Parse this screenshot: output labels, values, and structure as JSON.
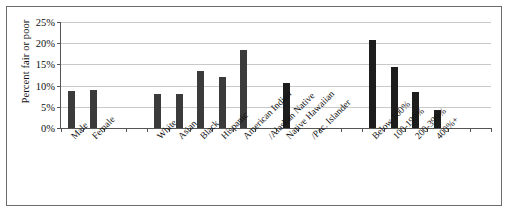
{
  "chart_data": {
    "type": "bar",
    "title": "",
    "subtitle": "",
    "xlabel": "",
    "ylabel": "Percent fair or poor",
    "ylim": [
      0,
      25
    ],
    "ytick_labels": [
      "0%",
      "5%",
      "10%",
      "15%",
      "20%",
      "25%"
    ],
    "ytick_values": [
      0,
      5,
      10,
      15,
      20,
      25
    ],
    "grid": true,
    "legend": "none",
    "units": "percent",
    "groups": [
      {
        "name": "Sex",
        "categories": [
          "Male",
          "Female"
        ],
        "values": [
          8.8,
          9.0
        ]
      },
      {
        "name": "Race/Ethnicity",
        "categories": [
          "White",
          "Asian",
          "Black",
          "Hispanic",
          "American Indian /Alaskan Native",
          "Native Hawaiian /Pac. Islander"
        ],
        "values": [
          8.0,
          8.0,
          13.5,
          12.0,
          18.5,
          10.5
        ]
      },
      {
        "name": "Income (% of poverty)",
        "categories": [
          "Below 100%",
          "100-199%",
          "200-399%",
          "400%+"
        ],
        "values": [
          20.7,
          14.5,
          8.5,
          4.2
        ]
      }
    ],
    "categories": [
      "Male",
      "Female",
      "White",
      "Asian",
      "Black",
      "Hispanic",
      "American Indian /Alaskan Native",
      "Native Hawaiian /Pac. Islander",
      "Below 100%",
      "100-199%",
      "200-399%",
      "400%+"
    ],
    "values": [
      8.8,
      9.0,
      8.0,
      8.0,
      13.5,
      12.0,
      18.5,
      10.5,
      20.7,
      14.5,
      8.5,
      4.2
    ],
    "bars": [
      {
        "slot": 1,
        "label_line1": "Male",
        "label_line2": "",
        "value": 8.8,
        "shade": "gray"
      },
      {
        "slot": 2,
        "label_line1": "Female",
        "label_line2": "",
        "value": 9.0,
        "shade": "gray"
      },
      {
        "slot": 5,
        "label_line1": "White",
        "label_line2": "",
        "value": 8.0,
        "shade": "gray"
      },
      {
        "slot": 6,
        "label_line1": "Asian",
        "label_line2": "",
        "value": 8.0,
        "shade": "gray"
      },
      {
        "slot": 7,
        "label_line1": "Black",
        "label_line2": "",
        "value": 13.5,
        "shade": "gray"
      },
      {
        "slot": 8,
        "label_line1": "Hispanic",
        "label_line2": "",
        "value": 12.0,
        "shade": "gray"
      },
      {
        "slot": 9,
        "label_line1": "American Indian",
        "label_line2": "/Alaskan Native",
        "value": 18.5,
        "shade": "gray"
      },
      {
        "slot": 11,
        "label_line1": "Native Hawaiian",
        "label_line2": "/Pac. Islander",
        "value": 10.5,
        "shade": "dark"
      },
      {
        "slot": 15,
        "label_line1": "Below 100%",
        "label_line2": "",
        "value": 20.7,
        "shade": "dark"
      },
      {
        "slot": 16,
        "label_line1": "100-199%",
        "label_line2": "",
        "value": 14.5,
        "shade": "dark"
      },
      {
        "slot": 17,
        "label_line1": "200-399%",
        "label_line2": "",
        "value": 8.5,
        "shade": "dark"
      },
      {
        "slot": 18,
        "label_line1": "400%+",
        "label_line2": "",
        "value": 4.2,
        "shade": "dark"
      }
    ],
    "slot_count": 20,
    "colors": {
      "bar_gray": "#3b3b3b",
      "bar_dark": "#1d1d1d",
      "gridline": "#c9c9c9",
      "axis": "#555555",
      "frame": "#6b6b6b",
      "text": "#111111",
      "background": "#ffffff"
    }
  }
}
